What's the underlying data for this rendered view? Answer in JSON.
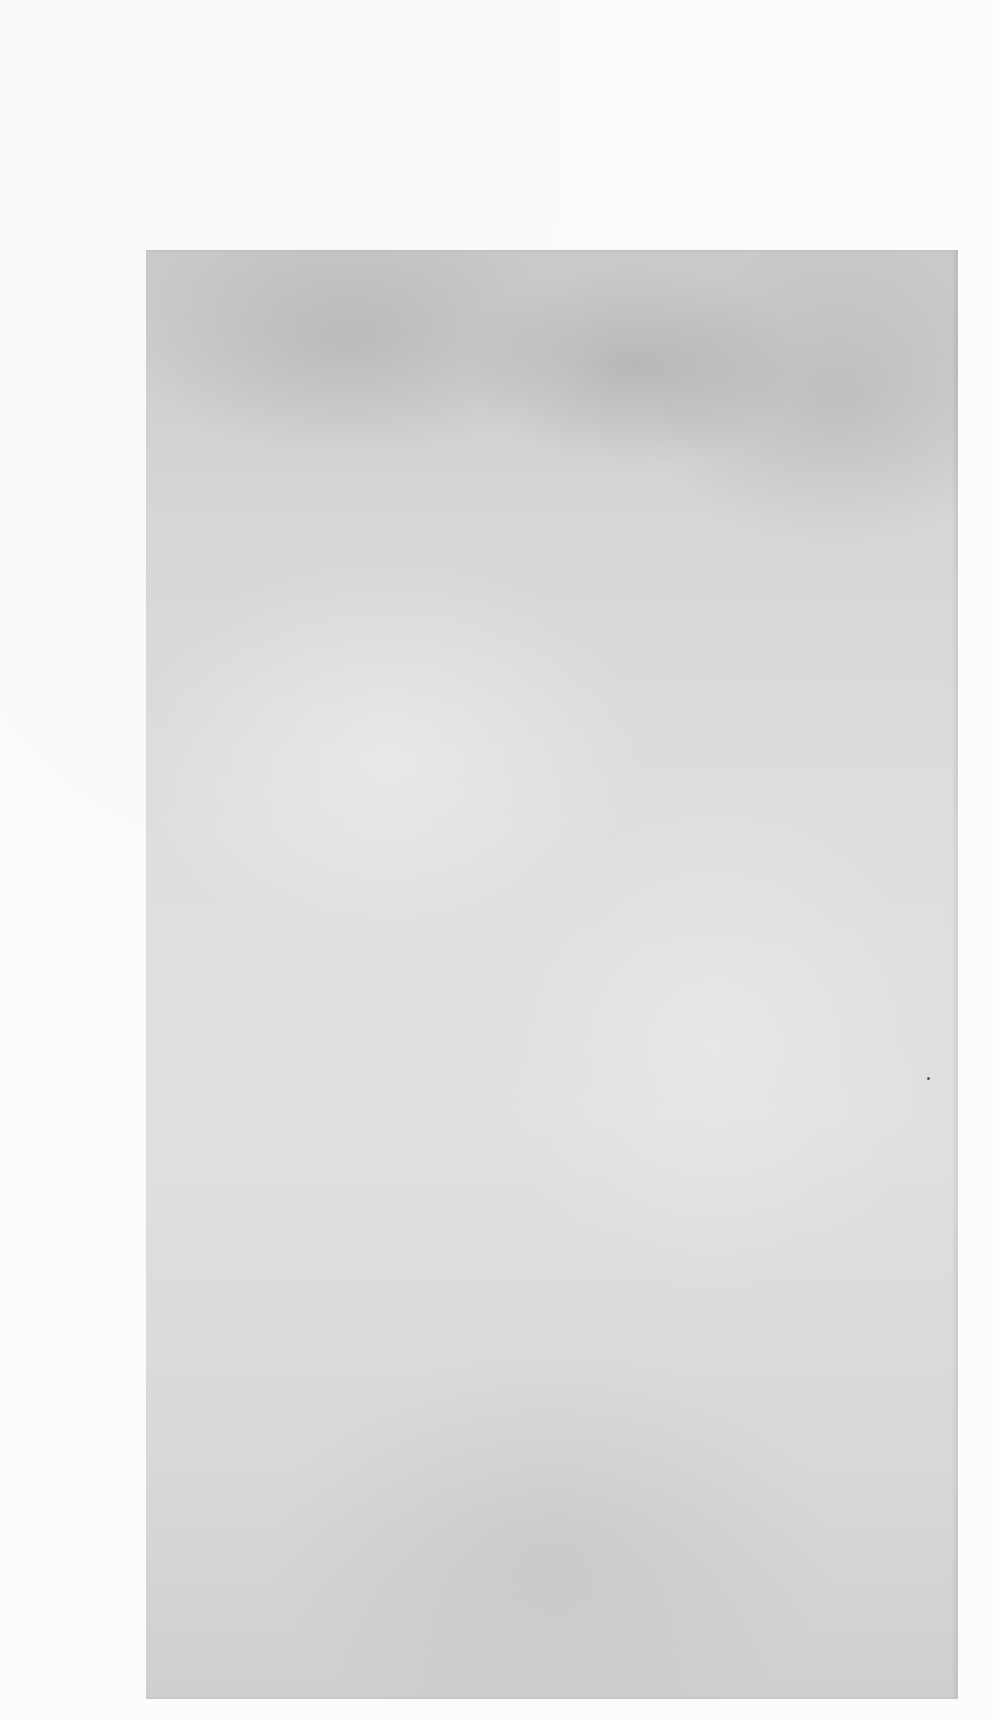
{
  "page": {
    "background_color": "#fbfbfb",
    "plate": {
      "description": "gray mottled rectangle",
      "color": "#d8d8d8"
    },
    "text": []
  }
}
